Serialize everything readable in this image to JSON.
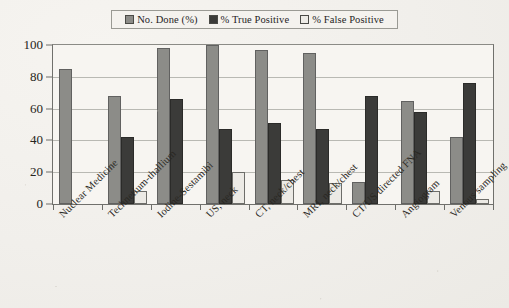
{
  "legend": {
    "position": "top-center",
    "entries": [
      {
        "label": "No. Done (%)",
        "swatch": "gray",
        "color": "#8c8c88"
      },
      {
        "label": "% True Positive",
        "swatch": "dark",
        "color": "#3b3b39"
      },
      {
        "label": "% False Positive",
        "swatch": "white",
        "color": "#edebe6"
      }
    ]
  },
  "chart_data": {
    "type": "bar",
    "title": "",
    "subtitle": "",
    "xlabel": "",
    "ylabel": "",
    "ylim": [
      0,
      100
    ],
    "yticks": [
      0,
      20,
      40,
      60,
      80,
      100
    ],
    "grid": true,
    "legend_position": "top-center",
    "categories": [
      "Nuclear Medicine",
      "Technetium-thallium",
      "Iodine-Sestamibi",
      "US, neck",
      "CT, neck/chest",
      "MRI, neck/chest",
      "CT/US directed FNA",
      "Angiogram",
      "Venous sampling"
    ],
    "series": [
      {
        "name": "No. Done (%)",
        "color": "#8c8c88",
        "values": [
          85,
          68,
          98,
          100,
          97,
          95,
          14,
          65,
          42
        ]
      },
      {
        "name": "% True Positive",
        "color": "#3b3b39",
        "values": [
          null,
          42,
          66,
          47,
          51,
          47,
          68,
          58,
          76
        ]
      },
      {
        "name": "% False Positive",
        "color": "#edebe6",
        "values": [
          null,
          8,
          null,
          20,
          15,
          13,
          null,
          8,
          3
        ]
      }
    ]
  }
}
